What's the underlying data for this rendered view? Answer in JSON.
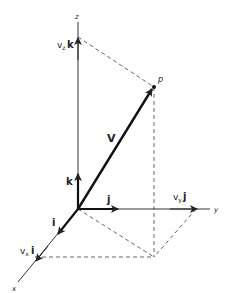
{
  "diagram": {
    "axes": {
      "x_label": "x",
      "y_label": "y",
      "z_label": "z"
    },
    "point_label": "p",
    "vector_label": "V",
    "unit_vectors": {
      "i": "i",
      "j": "j",
      "k": "k"
    },
    "components": {
      "x": {
        "scalar": "v",
        "sub": "x",
        "unit": "i"
      },
      "y": {
        "scalar": "v",
        "sub": "y",
        "unit": "j"
      },
      "z": {
        "scalar": "v",
        "sub": "z",
        "unit": "k"
      }
    },
    "colors": {
      "ink": "#222222",
      "dashed": "#555555",
      "background": "#ffffff"
    }
  }
}
